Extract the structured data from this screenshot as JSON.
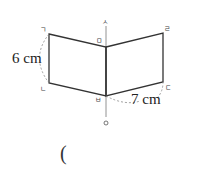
{
  "diagram": {
    "type": "folded-rectangle-rotation",
    "vertices": {
      "top_left": "ㄱ",
      "bottom_left": "ㄴ",
      "bottom_right": "ㄷ",
      "top_right": "ㄹ",
      "top_middle": "ㅁ",
      "bottom_middle": "ㅂ"
    },
    "axis": {
      "top_label": "ㅅ",
      "bottom_label": "ㅇ"
    },
    "measurements": {
      "height": "6 cm",
      "width": "7 cm"
    }
  },
  "answer": {
    "open_paren": "("
  }
}
